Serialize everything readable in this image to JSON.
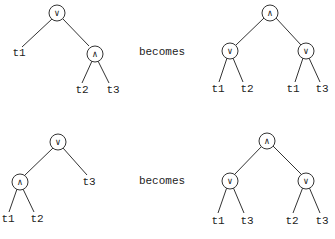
{
  "rows": [
    {
      "caption": "becomes",
      "before": {
        "root": "∨",
        "inner": "∧",
        "leaves": [
          "t1",
          "t2",
          "t3"
        ]
      },
      "after": {
        "root": "∧",
        "left": "∨",
        "right": "∨",
        "leaves": [
          "t1",
          "t2",
          "t1",
          "t3"
        ]
      }
    },
    {
      "caption": "becomes",
      "before": {
        "root": "∨",
        "inner": "∧",
        "leaves": [
          "t1",
          "t2",
          "t3"
        ]
      },
      "after": {
        "root": "∧",
        "left": "∨",
        "right": "∨",
        "leaves": [
          "t1",
          "t3",
          "t2",
          "t3"
        ]
      }
    }
  ]
}
